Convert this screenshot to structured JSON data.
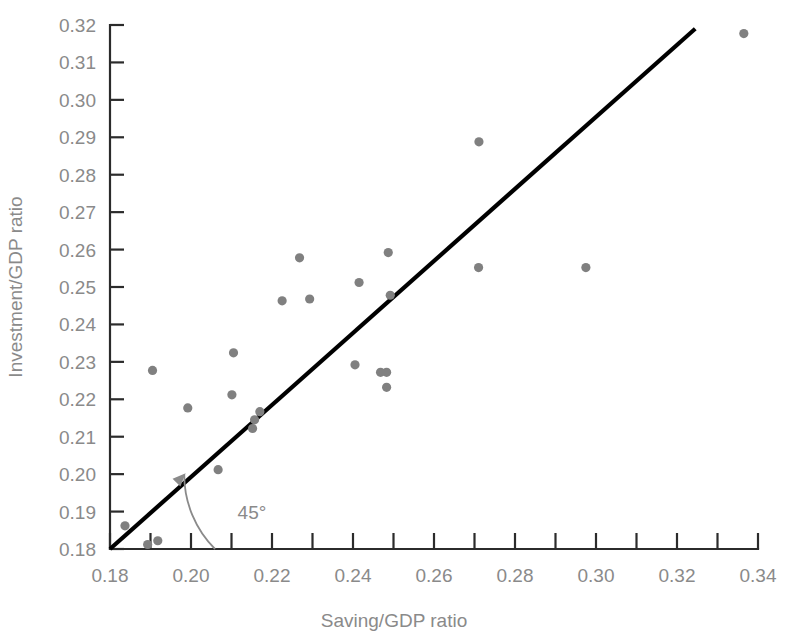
{
  "chart_data": {
    "type": "scatter",
    "title": "",
    "xlabel": "Saving/GDP ratio",
    "ylabel": "Investment/GDP ratio",
    "xlim": [
      0.18,
      0.34
    ],
    "ylim": [
      0.18,
      0.32
    ],
    "grid": false,
    "legend": null,
    "x_major_ticks": [
      0.18,
      0.2,
      0.22,
      0.24,
      0.26,
      0.28,
      0.3,
      0.32,
      0.34
    ],
    "x_tick_labels": [
      "0.18",
      "0.20",
      "0.22",
      "0.24",
      "0.26",
      "0.28",
      "0.30",
      "0.32",
      "0.34"
    ],
    "x_minor_ticks": [
      0.19,
      0.21,
      0.23,
      0.25,
      0.27,
      0.29,
      0.31,
      0.33
    ],
    "y_major_ticks": [
      0.18,
      0.19,
      0.2,
      0.21,
      0.22,
      0.23,
      0.24,
      0.25,
      0.26,
      0.27,
      0.28,
      0.29,
      0.3,
      0.31,
      0.32
    ],
    "y_tick_labels": [
      "0.18",
      "0.19",
      "0.20",
      "0.21",
      "0.22",
      "0.23",
      "0.24",
      "0.25",
      "0.26",
      "0.27",
      "0.28",
      "0.29",
      "0.30",
      "0.31",
      "0.32"
    ],
    "point_color": "#808080",
    "point_radius": 4.6,
    "reference_line": {
      "label": "45°",
      "slope": 1,
      "intercept": 0,
      "color": "#000000",
      "x_start": 0.18,
      "y_start": 0.18,
      "x_end": 0.3245,
      "y_end": 0.319
    },
    "annotation": {
      "text": "45°",
      "x": 0.2115,
      "y": 0.188
    },
    "x": [
      0.1837,
      0.1893,
      0.1918,
      0.1905,
      0.1992,
      0.2067,
      0.2105,
      0.2101,
      0.2152,
      0.2157,
      0.217,
      0.2225,
      0.2268,
      0.2293,
      0.2405,
      0.2415,
      0.2468,
      0.2483,
      0.2483,
      0.2487,
      0.2492,
      0.271,
      0.2711,
      0.2975,
      0.3365
    ],
    "y": [
      0.1862,
      0.1812,
      0.1822,
      0.2277,
      0.2177,
      0.2012,
      0.2324,
      0.2212,
      0.2122,
      0.2145,
      0.2167,
      0.2463,
      0.2578,
      0.2468,
      0.2292,
      0.2512,
      0.2272,
      0.2232,
      0.2272,
      0.2592,
      0.2478,
      0.2552,
      0.2888,
      0.2552,
      0.3177
    ],
    "points": [
      {
        "x": 0.1837,
        "y": 0.1862
      },
      {
        "x": 0.1893,
        "y": 0.1812
      },
      {
        "x": 0.1918,
        "y": 0.1822
      },
      {
        "x": 0.1905,
        "y": 0.2277
      },
      {
        "x": 0.1992,
        "y": 0.2177
      },
      {
        "x": 0.2067,
        "y": 0.2012
      },
      {
        "x": 0.2105,
        "y": 0.2324
      },
      {
        "x": 0.2101,
        "y": 0.2212
      },
      {
        "x": 0.2152,
        "y": 0.2122
      },
      {
        "x": 0.2157,
        "y": 0.2145
      },
      {
        "x": 0.217,
        "y": 0.2167
      },
      {
        "x": 0.2225,
        "y": 0.2463
      },
      {
        "x": 0.2268,
        "y": 0.2578
      },
      {
        "x": 0.2293,
        "y": 0.2468
      },
      {
        "x": 0.2405,
        "y": 0.2292
      },
      {
        "x": 0.2415,
        "y": 0.2512
      },
      {
        "x": 0.2468,
        "y": 0.2272
      },
      {
        "x": 0.2483,
        "y": 0.2232
      },
      {
        "x": 0.2483,
        "y": 0.2272
      },
      {
        "x": 0.2487,
        "y": 0.2592
      },
      {
        "x": 0.2492,
        "y": 0.2478
      },
      {
        "x": 0.271,
        "y": 0.2552
      },
      {
        "x": 0.2711,
        "y": 0.2888
      },
      {
        "x": 0.2975,
        "y": 0.2552
      },
      {
        "x": 0.3365,
        "y": 0.3177
      }
    ]
  }
}
